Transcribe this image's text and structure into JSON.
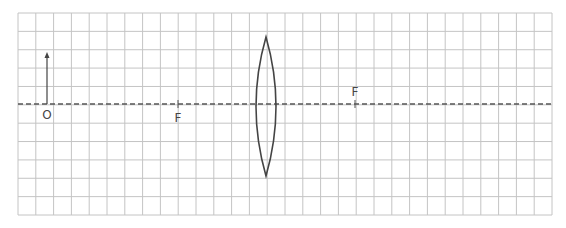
{
  "diagram": {
    "grid": {
      "left": 18,
      "top": 13,
      "right": 552,
      "bottom": 215,
      "cols": 30,
      "rows": 11,
      "line_color": "#c4c4c4"
    },
    "axis": {
      "y": 104,
      "style": "dashed",
      "color": "#555555"
    },
    "lens": {
      "type": "convex",
      "center_x": 266,
      "top_y": 37,
      "bottom_y": 176,
      "half_width": 10,
      "color": "#444444"
    },
    "object": {
      "label": "O",
      "x": 47,
      "base_y": 104,
      "tip_y": 52
    },
    "focal_points": [
      {
        "label": "F",
        "x": 178,
        "side": "left",
        "label_position": "below"
      },
      {
        "label": "F",
        "x": 355,
        "side": "right",
        "label_position": "above"
      }
    ]
  }
}
